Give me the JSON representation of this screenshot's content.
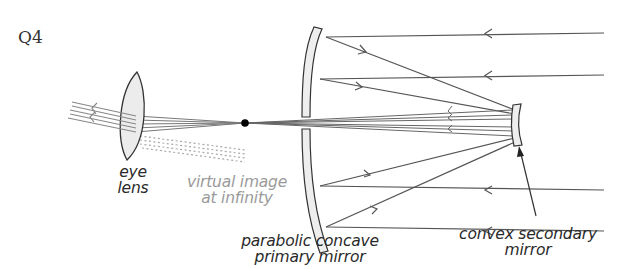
{
  "question": {
    "label": "Q4"
  },
  "labels": {
    "eye_lens": {
      "line1": "eye",
      "line2": "lens"
    },
    "virtual_image": {
      "line1": "virtual image",
      "line2": "at infinity"
    },
    "primary_mirror": {
      "line1": "parabolic concave",
      "line2": "primary mirror"
    },
    "secondary_mirror": {
      "line1": "convex secondary",
      "line2": "mirror"
    }
  },
  "colors": {
    "ray": "#555555",
    "mirror_fill": "#eeeeee",
    "mirror_stroke": "#444444",
    "lens_fill": "#eeeeee",
    "dotted": "#aaaaaa",
    "focal_point": "#000000"
  },
  "diagram": {
    "type": "Cassegrain reflecting telescope ray diagram",
    "incoming_ray_count": 4,
    "focal_point": "between primary mirror and eye lens"
  }
}
